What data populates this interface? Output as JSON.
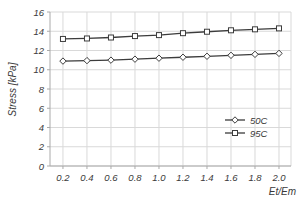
{
  "chart_data": {
    "type": "line",
    "title": "",
    "xlabel": "Et/Em",
    "ylabel": "Stress [kPa]",
    "x": [
      0.2,
      0.4,
      0.6,
      0.8,
      1.0,
      1.2,
      1.4,
      1.6,
      1.8,
      2.0
    ],
    "xtick_labels": [
      "0.2",
      "0.4",
      "0.6",
      "0.8",
      "1.0",
      "1.2",
      "1.4",
      "1.6",
      "1.8",
      "2.0"
    ],
    "yticks": [
      0,
      2,
      4,
      6,
      8,
      10,
      12,
      14,
      16
    ],
    "ytick_labels": [
      "0",
      "2",
      "4",
      "6",
      "8",
      "10",
      "12",
      "14",
      "16"
    ],
    "xlim": [
      0.092,
      2.1
    ],
    "ylim": [
      0,
      16
    ],
    "grid": true,
    "legend_position": "inside-right",
    "series": [
      {
        "name": "50C",
        "marker": "diamond",
        "values": [
          10.9,
          10.95,
          11.0,
          11.1,
          11.2,
          11.3,
          11.4,
          11.5,
          11.6,
          11.7
        ]
      },
      {
        "name": "95C",
        "marker": "square",
        "values": [
          13.2,
          13.25,
          13.35,
          13.5,
          13.6,
          13.8,
          13.95,
          14.1,
          14.2,
          14.3
        ]
      }
    ]
  },
  "colors": {
    "line": "#3c3c3c",
    "marker_fill": "#ffffff",
    "grid": "#d9d9d9",
    "axis": "#aaaaaa",
    "text": "#3a3a3a",
    "background": "#ffffff"
  }
}
